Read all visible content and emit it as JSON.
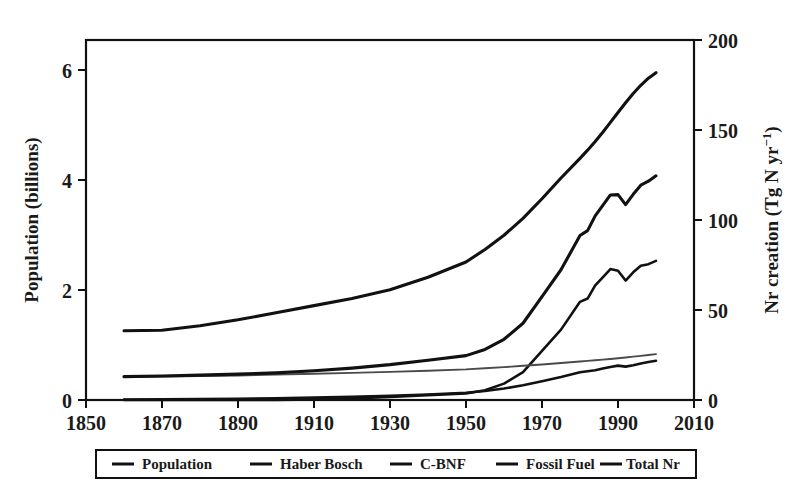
{
  "chart_data": {
    "type": "line",
    "title": "",
    "xlabel": "",
    "ylabel": "Population (billions)",
    "y2label": "Nr creation (Tg N yr−1)",
    "xlim": [
      1850,
      2010
    ],
    "ylim": [
      0,
      6.6
    ],
    "y2lim": [
      0,
      220
    ],
    "grid": false,
    "legend_position": "bottom",
    "xticks": [
      1850,
      1870,
      1890,
      1910,
      1930,
      1950,
      1970,
      1990,
      2010
    ],
    "xtick_labels": [
      "1850",
      "1870",
      "1890",
      "1910",
      "1930",
      "1950",
      "1970",
      "1990",
      "2010"
    ],
    "yticks": [
      0,
      2,
      4,
      6
    ],
    "ytick_labels": [
      "0",
      "2",
      "4",
      "6"
    ],
    "y2ticks": [
      0,
      50,
      100,
      150,
      200
    ],
    "y2tick_labels": [
      "0",
      "50",
      "100",
      "150",
      "200"
    ],
    "x": [
      1860,
      1870,
      1880,
      1890,
      1900,
      1910,
      1920,
      1930,
      1940,
      1950,
      1955,
      1960,
      1965,
      1970,
      1975,
      1980,
      1982,
      1984,
      1986,
      1988,
      1990,
      1992,
      1994,
      1996,
      1998,
      2000
    ],
    "series": [
      {
        "name": "Population",
        "axis": "left",
        "unit": "billions",
        "stroke": "#111111",
        "width": "thick",
        "values": [
          1.27,
          1.28,
          1.36,
          1.47,
          1.6,
          1.73,
          1.86,
          2.02,
          2.25,
          2.53,
          2.76,
          3.02,
          3.33,
          3.69,
          4.07,
          4.43,
          4.58,
          4.74,
          4.91,
          5.09,
          5.27,
          5.45,
          5.62,
          5.77,
          5.9,
          6.0
        ]
      },
      {
        "name": "Haber Bosch",
        "axis": "right",
        "unit": "Tg N yr-1",
        "stroke": "#111111",
        "width": "med",
        "values": [
          0,
          0,
          0,
          0,
          0,
          0.4,
          0.9,
          1.8,
          3.0,
          4.0,
          6.0,
          10.0,
          17.0,
          30.0,
          43.0,
          60.0,
          62.0,
          70.0,
          75.0,
          80.0,
          79.0,
          73.0,
          78.0,
          82.0,
          83.0,
          85.0
        ]
      },
      {
        "name": "C-BNF",
        "axis": "right",
        "unit": "Tg N yr-1",
        "stroke": "#4a4a4a",
        "width": "thin",
        "values": [
          14.0,
          14.3,
          14.6,
          15.0,
          15.5,
          16.0,
          16.6,
          17.2,
          17.9,
          18.7,
          19.4,
          20.1,
          20.9,
          21.7,
          22.6,
          23.5,
          23.9,
          24.3,
          24.7,
          25.1,
          25.5,
          26.0,
          26.5,
          27.0,
          27.5,
          28.0
        ]
      },
      {
        "name": "Fossil Fuel",
        "axis": "right",
        "unit": "Tg N yr-1",
        "stroke": "#111111",
        "width": "med",
        "values": [
          0.3,
          0.4,
          0.6,
          0.8,
          1.1,
          1.5,
          2.0,
          2.6,
          3.4,
          4.4,
          5.5,
          7.0,
          9.0,
          11.5,
          14.0,
          17.0,
          17.6,
          18.2,
          19.2,
          20.2,
          21.0,
          20.4,
          21.2,
          22.3,
          23.2,
          24.0
        ]
      },
      {
        "name": "Total Nr",
        "axis": "right",
        "unit": "Tg N yr-1",
        "stroke": "#111111",
        "width": "thick",
        "values": [
          14.3,
          14.7,
          15.2,
          15.8,
          16.6,
          17.9,
          19.5,
          21.6,
          24.3,
          27.1,
          30.9,
          37.1,
          46.9,
          63.2,
          79.6,
          100.5,
          103.5,
          112.5,
          118.9,
          125.3,
          125.5,
          119.4,
          125.7,
          131.3,
          133.7,
          137.0
        ]
      }
    ],
    "annotations": []
  },
  "legend": {
    "entries": [
      {
        "label": "Population"
      },
      {
        "label": "Haber Bosch"
      },
      {
        "label": "C-BNF"
      },
      {
        "label": "Fossil Fuel"
      },
      {
        "label": "Total Nr"
      }
    ]
  },
  "axis_titles": {
    "left": "Population (billions)",
    "right_main": "Nr creation (Tg N yr",
    "right_sup": "−1",
    "right_close": ")"
  }
}
